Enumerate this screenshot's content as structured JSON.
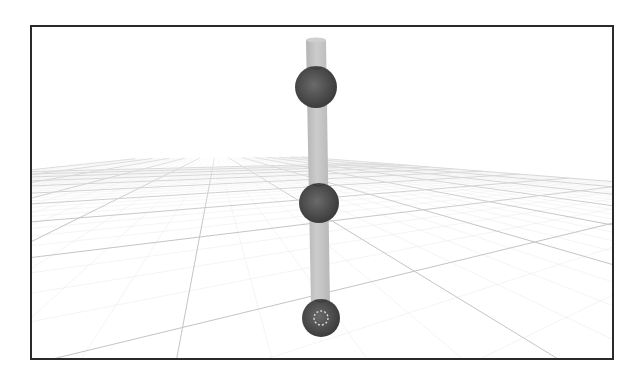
{
  "viewport": {
    "label": "3D viewport",
    "frame": {
      "x": 30,
      "y": 25,
      "width": 584,
      "height": 335,
      "border_color": "#2a2a2a"
    },
    "background_color": "#ffffff"
  },
  "scene": {
    "floor_grid": {
      "minor_color": "#ececec",
      "major_color": "#c4c4c4",
      "horizon_y": 150
    },
    "rod": {
      "color": "#bdbdbd",
      "highlight_color": "#cfcfcf",
      "top": {
        "x_left": 306,
        "x_right": 326,
        "y": 40
      },
      "bottom": {
        "x_left": 311,
        "x_right": 330,
        "y": 305
      }
    },
    "spheres": [
      {
        "name": "top-joint",
        "cx": 316,
        "cy": 87,
        "r": 21,
        "color": "#4a4a4a",
        "highlight": "#6a6a6a"
      },
      {
        "name": "middle-joint",
        "cx": 319,
        "cy": 203,
        "r": 20,
        "color": "#4a4a4a",
        "highlight": "#6a6a6a"
      },
      {
        "name": "bottom-joint",
        "cx": 321,
        "cy": 318,
        "r": 19,
        "color": "#464646",
        "highlight": "#5e5e5e"
      }
    ],
    "origin_marker": {
      "cx": 321,
      "cy": 318,
      "r": 7,
      "color": "#d8d8d8",
      "style": "dashed"
    }
  }
}
